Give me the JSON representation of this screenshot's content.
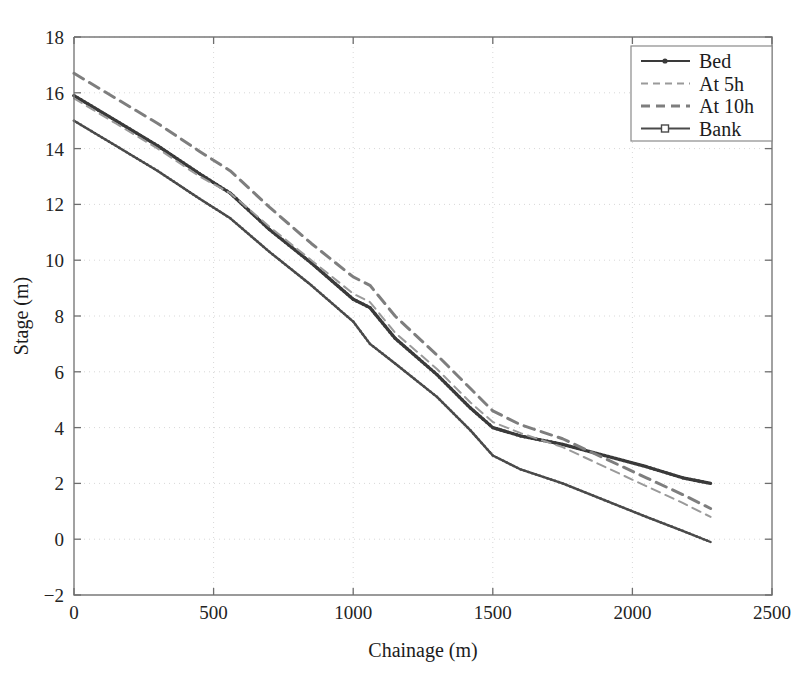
{
  "chart_data": {
    "type": "line",
    "title": "",
    "xlabel": "Chainage (m)",
    "ylabel": "Stage (m)",
    "xlim": [
      0,
      2500
    ],
    "ylim": [
      -2,
      18
    ],
    "xticks": [
      0,
      500,
      1000,
      1500,
      2000,
      2500
    ],
    "yticks": [
      -2,
      0,
      2,
      4,
      6,
      8,
      10,
      12,
      14,
      16,
      18
    ],
    "grid": true,
    "legend_position": "upper right",
    "legend_entries": [
      "Bed",
      "At 5h",
      "At 10h",
      "Bank"
    ],
    "series": [
      {
        "name": "Bed",
        "style": "solid-marker-dot",
        "color": "#3a3a3a",
        "linewidth": 3.2,
        "x": [
          0,
          150,
          300,
          450,
          560,
          700,
          850,
          1000,
          1060,
          1150,
          1300,
          1420,
          1500,
          1600,
          1750,
          1900,
          2050,
          2180,
          2280
        ],
        "y": [
          15.9,
          15.0,
          14.1,
          13.1,
          12.4,
          11.1,
          9.9,
          8.6,
          8.3,
          7.2,
          5.9,
          4.7,
          4.0,
          3.7,
          3.4,
          3.0,
          2.6,
          2.2,
          2.0
        ]
      },
      {
        "name": "At 5h",
        "style": "dashed-light",
        "color": "#9a9a9a",
        "linewidth": 2.0,
        "x": [
          0,
          150,
          300,
          450,
          560,
          700,
          850,
          1000,
          1060,
          1150,
          1300,
          1420,
          1500,
          1600,
          1750,
          1900,
          2050,
          2180,
          2280
        ],
        "y": [
          15.8,
          14.9,
          14.0,
          13.0,
          12.4,
          11.2,
          10.0,
          8.8,
          8.5,
          7.4,
          6.1,
          4.9,
          4.2,
          3.8,
          3.3,
          2.6,
          1.9,
          1.3,
          0.8
        ]
      },
      {
        "name": "At 10h",
        "style": "dashed-bold",
        "color": "#7e7e7e",
        "linewidth": 3.0,
        "x": [
          0,
          150,
          300,
          450,
          560,
          700,
          850,
          1000,
          1060,
          1150,
          1300,
          1420,
          1500,
          1600,
          1750,
          1900,
          2050,
          2180,
          2280
        ],
        "y": [
          16.7,
          15.8,
          14.9,
          13.9,
          13.2,
          11.9,
          10.6,
          9.4,
          9.1,
          8.0,
          6.6,
          5.4,
          4.6,
          4.1,
          3.6,
          2.9,
          2.2,
          1.6,
          1.1
        ]
      },
      {
        "name": "Bank",
        "style": "solid-marker-square",
        "color": "#4a4a4a",
        "linewidth": 2.4,
        "x": [
          0,
          150,
          300,
          450,
          560,
          700,
          850,
          1000,
          1060,
          1150,
          1300,
          1420,
          1500,
          1600,
          1750,
          1900,
          2050,
          2180,
          2280
        ],
        "y": [
          15.0,
          14.1,
          13.2,
          12.2,
          11.5,
          10.3,
          9.1,
          7.8,
          7.0,
          6.3,
          5.1,
          3.9,
          3.0,
          2.5,
          2.0,
          1.4,
          0.8,
          0.3,
          -0.1
        ]
      }
    ]
  },
  "axes": {
    "x_title": "Chainage (m)",
    "y_title": "Stage (m)",
    "x_tick_labels": [
      "0",
      "500",
      "1000",
      "1500",
      "2000",
      "2500"
    ],
    "y_tick_labels": [
      "-2",
      "0",
      "2",
      "4",
      "6",
      "8",
      "10",
      "12",
      "14",
      "16",
      "18"
    ]
  },
  "legend": {
    "items": [
      {
        "label": "Bed",
        "marker": "dot-marker-icon"
      },
      {
        "label": "At 5h",
        "marker": "dashed-light-icon"
      },
      {
        "label": "At 10h",
        "marker": "dashed-bold-icon"
      },
      {
        "label": "Bank",
        "marker": "square-marker-icon"
      }
    ]
  },
  "colors": {
    "background": "#ffffff",
    "axis": "#7a7a7a",
    "grid": "#d8d8d8",
    "bed": "#3a3a3a",
    "at5h": "#9a9a9a",
    "at10h": "#7e7e7e",
    "bank": "#4a4a4a"
  }
}
